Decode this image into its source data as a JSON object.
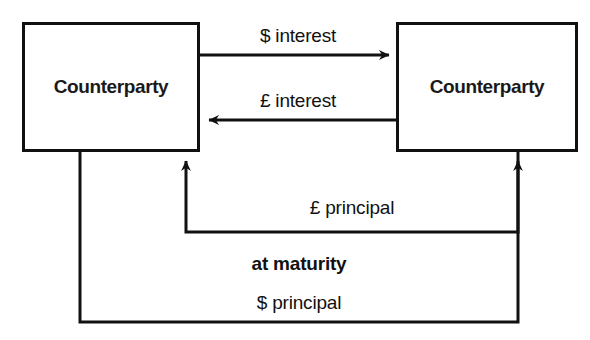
{
  "diagram": {
    "title_cropped": "",
    "boxes": [
      {
        "id": "counterparty-left",
        "label": "Counterparty"
      },
      {
        "id": "counterparty-right",
        "label": "Counterparty"
      }
    ],
    "flows": [
      {
        "id": "dollar-interest",
        "label": "$ interest",
        "from": "counterparty-left",
        "to": "counterparty-right",
        "direction": "right",
        "style": "bold_normal"
      },
      {
        "id": "pound-interest",
        "label": "£ interest",
        "from": "counterparty-right",
        "to": "counterparty-left",
        "direction": "left",
        "style": "normal"
      },
      {
        "id": "pound-principal",
        "label": "£ principal",
        "from": "counterparty-right",
        "to": "counterparty-left",
        "direction": "up-into-left",
        "style": "normal"
      },
      {
        "id": "dollar-principal",
        "label": "$ principal",
        "from": "counterparty-left",
        "to": "counterparty-right",
        "direction": "up-into-right",
        "style": "normal"
      }
    ],
    "annotations": [
      {
        "id": "at-maturity",
        "label": "at maturity",
        "style": "bold"
      }
    ],
    "colors": {
      "stroke": "#111111",
      "background": "#ffffff",
      "text": "#111111"
    }
  }
}
